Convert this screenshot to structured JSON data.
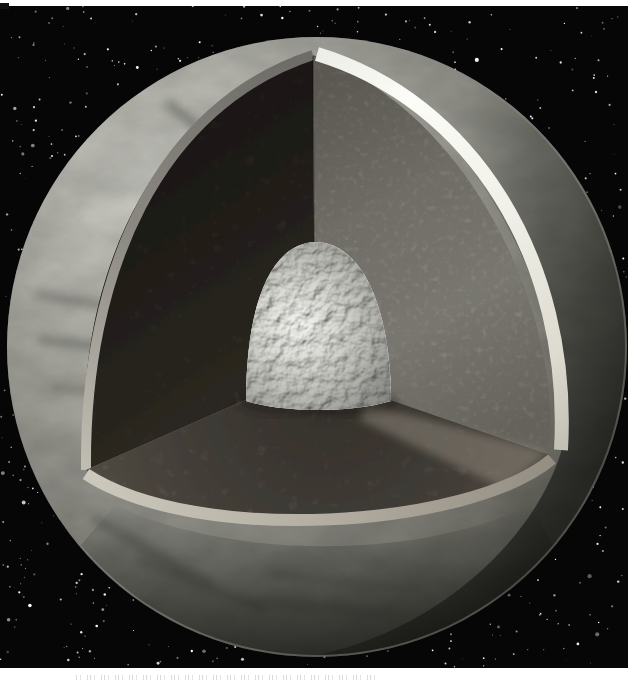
{
  "figure": {
    "kind": "scanned-book-figure",
    "layers": [
      {
        "name": "starfield-background"
      },
      {
        "name": "mottled-outer-surface"
      },
      {
        "name": "ice-shell-cross-section-band"
      },
      {
        "name": "mantle-left-cut-face"
      },
      {
        "name": "mantle-right-cut-face"
      },
      {
        "name": "mantle-floor-cut-plane"
      },
      {
        "name": "floor-rim-band"
      },
      {
        "name": "bumpy-central-core"
      }
    ]
  },
  "caption": {
    "legible_text": "",
    "note_illegible_cutoff_text_present": true
  },
  "palette": {
    "page_white": "#ffffff",
    "space_black": "#060606",
    "star_white": "#ffffff",
    "surface_light": "#d8d8d2",
    "surface_mid": "#a8a8a0",
    "surface_dark_limb": "#565650",
    "ice_band_white": "#fafaf6",
    "shell_band_gray": "#8b8982",
    "mantle_face_dark": "#2e2a24",
    "mantle_face_light": "#8f8c84",
    "floor_brown": "#58524a",
    "rim_tan": "#b4aea2",
    "core_silver": "#d6d6d0",
    "core_highlight": "#f6f6f2"
  },
  "stars": {
    "count": 1050,
    "seed": 987231
  }
}
